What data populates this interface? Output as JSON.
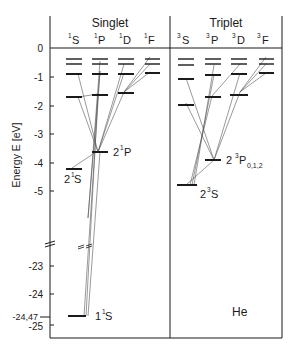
{
  "element_label": "He",
  "y_axis": {
    "label": "Energy E [eV]",
    "ticks_upper": [
      {
        "value": 0,
        "label": "0"
      },
      {
        "value": -1,
        "label": "-1"
      },
      {
        "value": -2,
        "label": "-2"
      },
      {
        "value": -3,
        "label": "-3"
      },
      {
        "value": -4,
        "label": "-4"
      },
      {
        "value": -5,
        "label": "-5"
      }
    ],
    "ticks_lower": [
      {
        "value": -23,
        "label": "-23"
      },
      {
        "value": -24,
        "label": "-24"
      },
      {
        "value": -24.47,
        "label": "-24,47"
      },
      {
        "value": -25,
        "label": "-25"
      }
    ],
    "axis_break": true
  },
  "panels": [
    {
      "title": "Singlet",
      "columns": [
        {
          "sup": "1",
          "term": "S"
        },
        {
          "sup": "1",
          "term": "P"
        },
        {
          "sup": "1",
          "term": "D"
        },
        {
          "sup": "1",
          "term": "F"
        }
      ]
    },
    {
      "title": "Triplet",
      "columns": [
        {
          "sup": "3",
          "term": "S"
        },
        {
          "sup": "3",
          "term": "P"
        },
        {
          "sup": "3",
          "term": "D"
        },
        {
          "sup": "3",
          "term": "F"
        }
      ]
    }
  ],
  "labels": {
    "s21": {
      "main": "2",
      "sup": "1",
      "term": "S"
    },
    "p21": {
      "main": "2",
      "sup": "1",
      "term": "P"
    },
    "s11": {
      "main": "1",
      "sup": "1",
      "term": "S"
    },
    "s23": {
      "main": "2",
      "sup": "3",
      "term": "S"
    },
    "p23": {
      "main": "2",
      "sup": "3",
      "term": "P",
      "sub": "0,1,2"
    }
  },
  "levels": {
    "singlet_S": [
      -24.47,
      -4.2,
      -1.7,
      -0.9,
      -0.55,
      -0.33
    ],
    "singlet_P": [
      -3.6,
      -1.6,
      -0.87,
      -0.55,
      -0.33
    ],
    "singlet_D": [
      -1.55,
      -0.87,
      -0.55,
      -0.33
    ],
    "singlet_F": [
      -0.86,
      -0.55,
      -0.33
    ],
    "triplet_S": [
      -4.77,
      -1.9,
      -1.05,
      -0.6,
      -0.33
    ],
    "triplet_P": [
      -3.85,
      -1.65,
      -0.95,
      -0.55,
      -0.33
    ],
    "triplet_D": [
      -1.55,
      -0.87,
      -0.55,
      -0.33
    ],
    "triplet_F": [
      -0.86,
      -0.55,
      -0.33
    ]
  },
  "colors": {
    "line": "#1a1a1a",
    "transition": "#555555",
    "background": "#ffffff"
  }
}
